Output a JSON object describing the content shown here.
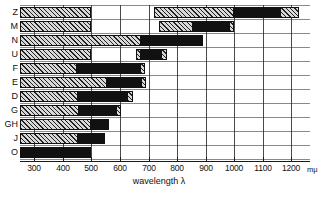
{
  "chart_data": {
    "type": "bar",
    "orientation": "horizontal",
    "title": "",
    "xlabel": "wavelength λ",
    "x_unit": "mμ",
    "ylabel": "",
    "xlim": [
      250,
      1230
    ],
    "grid": true,
    "legend": [],
    "x_ticks": [
      300,
      400,
      500,
      600,
      700,
      800,
      900,
      1000,
      1100,
      1200
    ],
    "categories": [
      "Z",
      "M",
      "N",
      "U",
      "F",
      "E",
      "D",
      "G",
      "GH",
      "J",
      "O"
    ],
    "series_note": "Each category is a set of wavelength bands; hatched = partial/secondary band, solid black = main band.",
    "rows": [
      {
        "label": "Z",
        "segments": [
          {
            "from": 250,
            "to": 500,
            "fill": "hatch"
          },
          {
            "from": 720,
            "to": 1000,
            "fill": "hatch"
          },
          {
            "from": 1000,
            "to": 1160,
            "fill": "solid"
          },
          {
            "from": 1160,
            "to": 1225,
            "fill": "hatch"
          }
        ]
      },
      {
        "label": "M",
        "segments": [
          {
            "from": 250,
            "to": 500,
            "fill": "hatch"
          },
          {
            "from": 735,
            "to": 855,
            "fill": "hatch"
          },
          {
            "from": 855,
            "to": 980,
            "fill": "solid"
          },
          {
            "from": 980,
            "to": 1000,
            "fill": "hatch"
          }
        ]
      },
      {
        "label": "N",
        "segments": [
          {
            "from": 250,
            "to": 675,
            "fill": "hatch"
          },
          {
            "from": 675,
            "to": 890,
            "fill": "solid"
          }
        ]
      },
      {
        "label": "U",
        "segments": [
          {
            "from": 250,
            "to": 500,
            "fill": "hatch"
          },
          {
            "from": 655,
            "to": 675,
            "fill": "hatch"
          },
          {
            "from": 675,
            "to": 745,
            "fill": "solid"
          },
          {
            "from": 745,
            "to": 765,
            "fill": "hatch"
          }
        ]
      },
      {
        "label": "F",
        "segments": [
          {
            "from": 250,
            "to": 450,
            "fill": "hatch"
          },
          {
            "from": 450,
            "to": 670,
            "fill": "solid"
          },
          {
            "from": 670,
            "to": 688,
            "fill": "hatch"
          }
        ]
      },
      {
        "label": "E",
        "segments": [
          {
            "from": 250,
            "to": 555,
            "fill": "hatch"
          },
          {
            "from": 555,
            "to": 672,
            "fill": "solid"
          },
          {
            "from": 672,
            "to": 692,
            "fill": "hatch"
          }
        ]
      },
      {
        "label": "D",
        "segments": [
          {
            "from": 250,
            "to": 452,
            "fill": "hatch"
          },
          {
            "from": 452,
            "to": 625,
            "fill": "solid"
          },
          {
            "from": 625,
            "to": 645,
            "fill": "hatch"
          }
        ]
      },
      {
        "label": "G",
        "segments": [
          {
            "from": 250,
            "to": 455,
            "fill": "hatch"
          },
          {
            "from": 455,
            "to": 585,
            "fill": "solid"
          },
          {
            "from": 585,
            "to": 602,
            "fill": "hatch"
          }
        ]
      },
      {
        "label": "GH",
        "segments": [
          {
            "from": 250,
            "to": 500,
            "fill": "hatch"
          },
          {
            "from": 500,
            "to": 562,
            "fill": "solid"
          }
        ]
      },
      {
        "label": "J",
        "segments": [
          {
            "from": 250,
            "to": 452,
            "fill": "hatch"
          },
          {
            "from": 452,
            "to": 548,
            "fill": "solid"
          }
        ]
      },
      {
        "label": "O",
        "segments": [
          {
            "from": 250,
            "to": 500,
            "fill": "solid"
          }
        ]
      }
    ]
  }
}
